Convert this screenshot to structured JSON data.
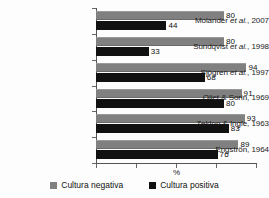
{
  "chart_data": {
    "type": "bar",
    "orientation": "horizontal",
    "title": "",
    "xlabel": "%",
    "ylabel": "",
    "xlim": [
      0,
      100
    ],
    "grid": false,
    "legend_position": "bottom",
    "x_tick_labels": [
      "",
      "",
      "",
      ""
    ],
    "categories": [
      "Molander et al., 2007",
      "Sundqvist et al., 1998",
      "Sjögren et al., 1997",
      "Oliet & Sorin, 1969",
      "Zeldon & Ingle, 1963",
      "Engströn, 1964"
    ],
    "category_parts": [
      {
        "lead": "Molander ",
        "italic": "et al.",
        "trail": ", 2007"
      },
      {
        "lead": "Sundqvist ",
        "italic": "et al.",
        "trail": ", 1998"
      },
      {
        "lead": "Sjögren ",
        "italic": "et al.",
        "trail": ", 1997"
      },
      {
        "lead": "Oliet & Sorin, 1969",
        "italic": "",
        "trail": ""
      },
      {
        "lead": "Zeldon & Ingle, 1963",
        "italic": "",
        "trail": ""
      },
      {
        "lead": "Engströn, 1964",
        "italic": "",
        "trail": ""
      }
    ],
    "series": [
      {
        "name": "Cultura negativa",
        "color": "#808080",
        "values": [
          80,
          80,
          94,
          91,
          93,
          89
        ]
      },
      {
        "name": "Cultura positiva",
        "color": "#111111",
        "values": [
          44,
          33,
          68,
          80,
          83,
          76
        ]
      }
    ]
  },
  "legend": {
    "items": [
      {
        "label": "Cultura negativa",
        "color": "#808080"
      },
      {
        "label": "Cultura positiva",
        "color": "#111111"
      }
    ]
  },
  "axis": {
    "x_title": "%"
  }
}
